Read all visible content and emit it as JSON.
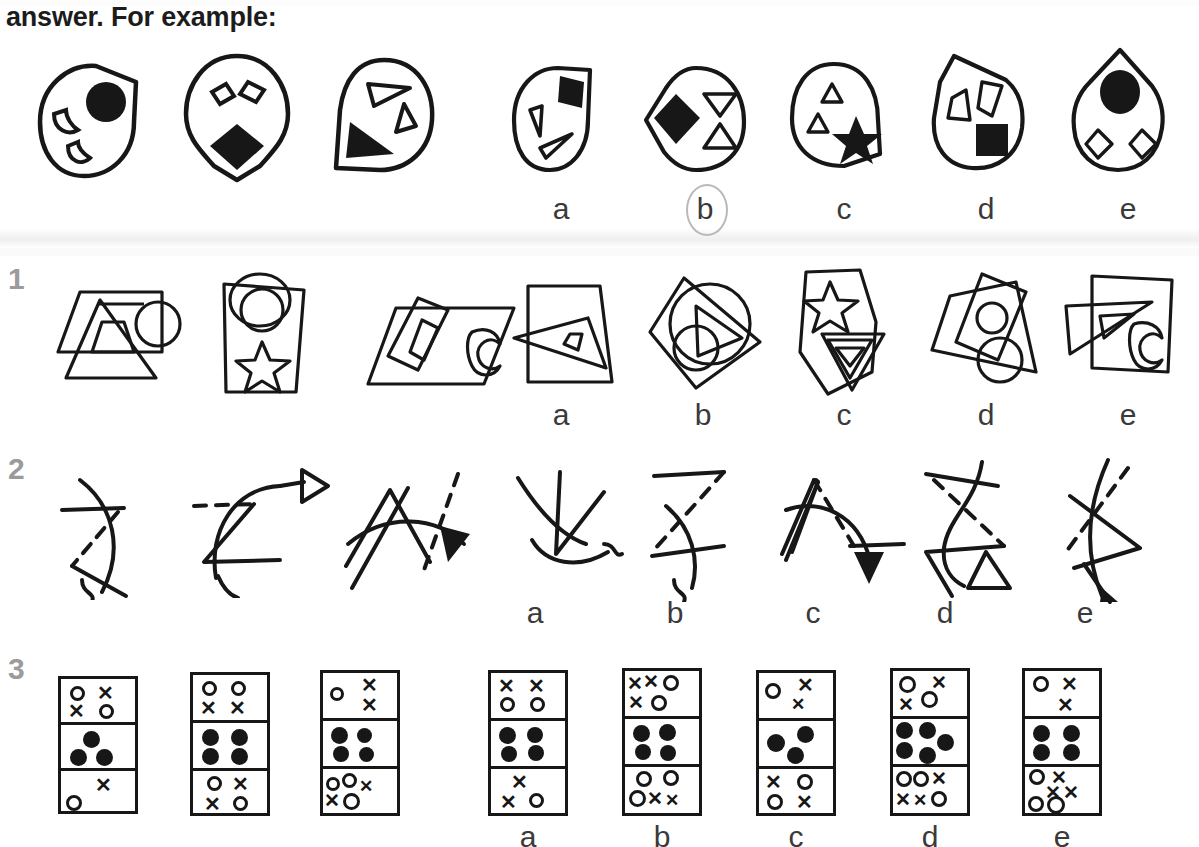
{
  "page": {
    "intro_text": "answer. For example:",
    "cut_top_text": "",
    "background": "#ffffff",
    "ink": "#171717",
    "rownum_color": "#9b9b9b",
    "ring_color": "#b9b9b9"
  },
  "option_letters": [
    "a",
    "b",
    "c",
    "d",
    "e"
  ],
  "rows": [
    {
      "id": "example",
      "number": "",
      "label": "example-row",
      "circled_answer": "b",
      "stimuli": [
        {
          "name": "blob-circle-cut-corner",
          "outline": "blob-with-flat-top-right",
          "contents": [
            "crescent-outline",
            "filled-circle",
            "crescent-outline"
          ]
        },
        {
          "name": "teardrop-down",
          "outline": "teardrop-point-down",
          "contents": [
            "diamond-outline",
            "diamond-outline",
            "filled-diamond"
          ]
        },
        {
          "name": "blob-flat-bottom-left",
          "outline": "blob-with-flat-bottom-left",
          "contents": [
            "triangle-outline",
            "triangle-outline",
            "filled-triangle"
          ]
        }
      ],
      "options": [
        {
          "letter": "a",
          "name": "blob-flat-top-right",
          "outline": "blob-with-flat-top-right",
          "contents": [
            "triangle-outline",
            "filled-pentagon",
            "triangle-outline"
          ]
        },
        {
          "letter": "b",
          "name": "blob-point-left",
          "outline": "blob-with-point-left",
          "contents": [
            "filled-diamond",
            "triangle-down-outline",
            "triangle-up-outline"
          ]
        },
        {
          "letter": "c",
          "name": "blob-flat-bottom-right",
          "outline": "blob-with-flat-bottom-right",
          "contents": [
            "triangle-outline",
            "triangle-outline",
            "filled-star"
          ]
        },
        {
          "letter": "d",
          "name": "teardrop-point-up-left",
          "outline": "teardrop-point-top-left",
          "contents": [
            "triangle-outline",
            "triangle-outline",
            "filled-square"
          ]
        },
        {
          "letter": "e",
          "name": "teardrop-point-up",
          "outline": "teardrop-point-up",
          "contents": [
            "filled-ellipse",
            "diamond-outline",
            "diamond-outline"
          ]
        }
      ]
    },
    {
      "id": "q1",
      "number": "1",
      "label": "question-1-overlapping-outline-shapes",
      "circled_answer": null,
      "stimuli": [
        {
          "name": "parallelogram-triangle-circle",
          "parts": [
            "parallelogram",
            "triangle",
            "inner-triangle",
            "circle"
          ]
        },
        {
          "name": "tapered-rect-circle-star",
          "parts": [
            "tapered-rectangle",
            "circle",
            "inner-circle",
            "star"
          ]
        },
        {
          "name": "parallelogram-rect-moon",
          "parts": [
            "parallelogram",
            "rotated-rectangle",
            "inner-rectangle",
            "crescent-moon"
          ]
        }
      ],
      "options": [
        {
          "letter": "a",
          "name": "trapezoid-with-triangles",
          "parts": [
            "trapezoid",
            "triangle",
            "inner-triangle"
          ]
        },
        {
          "letter": "b",
          "name": "diamond-circles-triangle",
          "parts": [
            "diamond",
            "circle",
            "small-circle",
            "triangle"
          ]
        },
        {
          "letter": "c",
          "name": "pentagon-star-triangles",
          "parts": [
            "pentagon",
            "star",
            "triangle",
            "inner-triangle"
          ]
        },
        {
          "letter": "d",
          "name": "quad-rect-circles",
          "parts": [
            "quadrilateral",
            "rotated-rectangle",
            "circle",
            "circle"
          ]
        },
        {
          "letter": "e",
          "name": "rect-triangle-moon",
          "parts": [
            "rectangle",
            "triangle",
            "inner-triangle",
            "crescent-moon"
          ]
        }
      ]
    },
    {
      "id": "q2",
      "number": "2",
      "label": "question-2-lines-curves-arrows",
      "circled_answer": null,
      "stimuli": [
        {
          "name": "curve-line-dash-hook",
          "parts": [
            "arc",
            "straight-line",
            "dashed-line",
            "hook"
          ]
        },
        {
          "name": "curve-dash-open-arrow",
          "parts": [
            "arc",
            "dashed-line",
            "zigzag",
            "open-arrowhead"
          ]
        },
        {
          "name": "arc-zigzag-dash-filled-arrow",
          "parts": [
            "arc",
            "zigzag",
            "dashed-line",
            "filled-arrowhead"
          ]
        }
      ],
      "options": [
        {
          "letter": "a",
          "name": "arc-zigzag-hook",
          "parts": [
            "arc",
            "zigzag",
            "hook"
          ]
        },
        {
          "letter": "b",
          "name": "line-dash-curve-hook",
          "parts": [
            "straight-line",
            "dashed-line",
            "arc",
            "hook"
          ]
        },
        {
          "letter": "c",
          "name": "arc-dash-filled-arrow",
          "parts": [
            "arc",
            "dashed-line",
            "straight-line",
            "filled-arrowhead"
          ]
        },
        {
          "letter": "d",
          "name": "curve-dash-open-triangle",
          "parts": [
            "curve",
            "dashed-line",
            "zigzag",
            "open-triangle"
          ]
        },
        {
          "letter": "e",
          "name": "curve-dash-arrow",
          "parts": [
            "curve",
            "dashed-line",
            "zigzag",
            "arrow"
          ]
        }
      ]
    },
    {
      "id": "q3",
      "number": "3",
      "label": "question-3-three-cell-dominoes",
      "circled_answer": null,
      "stimuli": [
        {
          "name": "domino-1",
          "cells": [
            [
              "o",
              "x",
              "x",
              "o"
            ],
            [
              "dot",
              "dot",
              "dot"
            ],
            [
              "x",
              "o"
            ]
          ]
        },
        {
          "name": "domino-2",
          "cells": [
            [
              "o",
              "o",
              "x",
              "x"
            ],
            [
              "dot",
              "dot",
              "dot",
              "dot"
            ],
            [
              "o",
              "x",
              "x",
              "o"
            ]
          ]
        },
        {
          "name": "domino-3",
          "cells": [
            [
              "o",
              "x",
              "x"
            ],
            [
              "dot",
              "dot",
              "dot",
              "dot"
            ],
            [
              "o",
              "o",
              "x",
              "x",
              "o"
            ]
          ]
        }
      ],
      "options": [
        {
          "letter": "a",
          "name": "domino-a",
          "cells": [
            [
              "x",
              "x",
              "o",
              "o"
            ],
            [
              "dot",
              "dot",
              "dot",
              "dot"
            ],
            [
              "x",
              "x",
              "o"
            ]
          ]
        },
        {
          "letter": "b",
          "name": "domino-b",
          "cells": [
            [
              "x",
              "x",
              "o",
              "x",
              "o"
            ],
            [
              "dot",
              "dot",
              "dot",
              "dot"
            ],
            [
              "o",
              "o",
              "o",
              "x",
              "x"
            ]
          ]
        },
        {
          "letter": "c",
          "name": "domino-c",
          "cells": [
            [
              "o",
              "x",
              "x"
            ],
            [
              "dot",
              "dot",
              "dot"
            ],
            [
              "x",
              "o",
              "o",
              "x"
            ]
          ]
        },
        {
          "letter": "d",
          "name": "domino-d",
          "cells": [
            [
              "o",
              "x",
              "x",
              "o"
            ],
            [
              "dot",
              "dot",
              "dot",
              "dot",
              "dot"
            ],
            [
              "o",
              "o",
              "x",
              "x",
              "x",
              "o"
            ]
          ]
        },
        {
          "letter": "e",
          "name": "domino-e",
          "cells": [
            [
              "o",
              "x",
              "x"
            ],
            [
              "dot",
              "dot",
              "dot",
              "dot"
            ],
            [
              "o",
              "x",
              "x",
              "x",
              "o",
              "o"
            ]
          ]
        }
      ]
    }
  ]
}
